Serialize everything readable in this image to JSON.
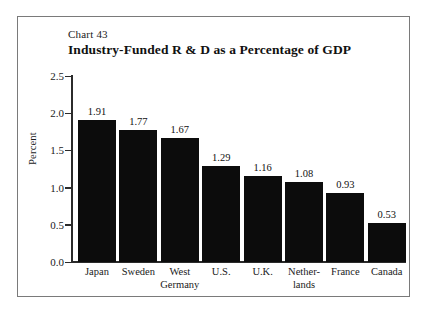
{
  "figure": {
    "chart_number": "Chart 43",
    "title": "Industry-Funded R & D as a Percentage of GDP",
    "border_color": "#7a7a7a",
    "background_color": "#ffffff",
    "bar_color": "#0c0c0c",
    "axis_color": "#2b2b2b"
  },
  "chart_data": {
    "type": "bar",
    "title": "Industry-Funded R & D as a Percentage of GDP",
    "subtitle": "Chart 43",
    "xlabel": "",
    "ylabel": "Percent",
    "ylim": [
      0.0,
      2.5
    ],
    "yticks": [
      0.0,
      0.5,
      1.0,
      1.5,
      2.0,
      2.5
    ],
    "ytick_labels": [
      "0.0",
      "0.5",
      "1.0",
      "1.5",
      "2.0",
      "2.5"
    ],
    "grid": false,
    "legend": false,
    "categories": [
      "Japan",
      "Sweden",
      "West Germany",
      "U.S.",
      "U.K.",
      "Netherlands",
      "France",
      "Canada"
    ],
    "category_label_lines": [
      [
        "Japan",
        ""
      ],
      [
        "Sweden",
        ""
      ],
      [
        "West",
        "Germany"
      ],
      [
        "U.S.",
        ""
      ],
      [
        "U.K.",
        ""
      ],
      [
        "Nether-",
        "lands"
      ],
      [
        "France",
        ""
      ],
      [
        "Canada",
        ""
      ]
    ],
    "values": [
      1.91,
      1.77,
      1.67,
      1.29,
      1.16,
      1.08,
      0.93,
      0.53
    ],
    "value_labels": [
      "1.91",
      "1.77",
      "1.67",
      "1.29",
      "1.16",
      "1.08",
      "0.93",
      "0.53"
    ]
  }
}
